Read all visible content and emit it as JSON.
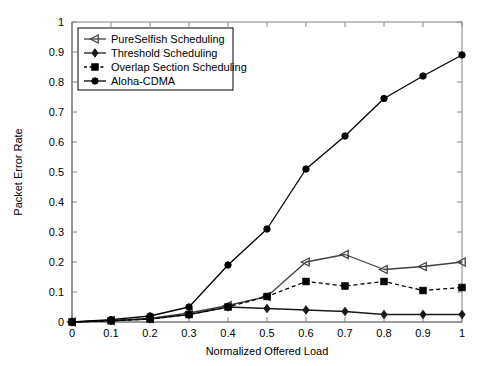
{
  "chart_data": {
    "type": "line",
    "title": "",
    "xlabel": "Normalized Offered Load",
    "ylabel": "Packet Error Rate",
    "xlim": [
      0,
      1
    ],
    "ylim": [
      0,
      1
    ],
    "xticks": [
      "0",
      "0.1",
      "0.2",
      "0.3",
      "0.4",
      "0.5",
      "0.6",
      "0.7",
      "0.8",
      "0.9",
      "1"
    ],
    "yticks": [
      "0",
      "0.1",
      "0.2",
      "0.3",
      "0.4",
      "0.5",
      "0.6",
      "0.7",
      "0.8",
      "0.9",
      "1"
    ],
    "grid": false,
    "legend_position": "upper-left",
    "x": [
      0,
      0.1,
      0.2,
      0.3,
      0.4,
      0.5,
      0.6,
      0.7,
      0.8,
      0.9,
      1
    ],
    "series": [
      {
        "name": "PureSelfish Scheduling",
        "marker": "left-triangle",
        "linestyle": "solid",
        "color": "#404040",
        "values": [
          0,
          0.005,
          0.012,
          0.03,
          0.055,
          0.085,
          0.2,
          0.225,
          0.175,
          0.185,
          0.2
        ]
      },
      {
        "name": "Threshold Scheduling",
        "marker": "diamond",
        "linestyle": "solid",
        "color": "#1a1a1a",
        "values": [
          0,
          0.004,
          0.01,
          0.025,
          0.05,
          0.045,
          0.04,
          0.035,
          0.025,
          0.025,
          0.025
        ]
      },
      {
        "name": "Overlap Section Scheduling",
        "marker": "square",
        "linestyle": "dashed",
        "color": "#000000",
        "values": [
          0,
          0.004,
          0.01,
          0.025,
          0.05,
          0.085,
          0.135,
          0.12,
          0.135,
          0.105,
          0.115
        ]
      },
      {
        "name": "Aloha-CDMA",
        "marker": "circle",
        "linestyle": "solid",
        "color": "#000000",
        "values": [
          0,
          0.008,
          0.02,
          0.05,
          0.19,
          0.31,
          0.51,
          0.62,
          0.745,
          0.82,
          0.89
        ]
      }
    ]
  },
  "legend": {
    "entries": [
      "PureSelfish Scheduling",
      "Threshold Scheduling",
      "Overlap Section Scheduling",
      "Aloha-CDMA"
    ]
  }
}
